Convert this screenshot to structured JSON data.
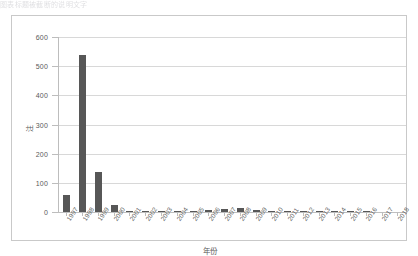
{
  "top_caption": "图表标题被截断的说明文字",
  "chart_data": {
    "type": "bar",
    "title": "",
    "xlabel": "年份",
    "ylabel": "注",
    "categories": [
      "1997",
      "1998",
      "1999",
      "2000",
      "2001",
      "2002",
      "2003",
      "2004",
      "2005",
      "2006",
      "2007",
      "2008",
      "2009",
      "2010",
      "2011",
      "2012",
      "2013",
      "2014",
      "2015",
      "2016",
      "2017",
      "2018"
    ],
    "values": [
      58,
      540,
      138,
      25,
      5,
      3,
      2,
      4,
      3,
      7,
      9,
      14,
      6,
      3,
      2,
      3,
      2,
      1,
      1,
      1,
      0,
      0
    ],
    "ylim": [
      0,
      600
    ],
    "yticks": [
      0,
      100,
      200,
      300,
      400,
      500,
      600
    ],
    "ytick_labels": [
      "0",
      "100",
      "200",
      "300",
      "400",
      "500",
      "600"
    ],
    "grid": true,
    "legend": false,
    "bar_color": "#575757",
    "grid_color": "#d8d8d8",
    "axis_color": "#bdbdbd",
    "frame_color": "#c9c9c9"
  }
}
